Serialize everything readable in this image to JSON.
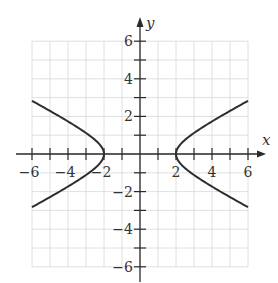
{
  "chart_data": {
    "type": "line",
    "title": "",
    "xlabel": "x",
    "ylabel": "y",
    "xlim": [
      -6,
      6
    ],
    "ylim": [
      -6,
      6
    ],
    "grid": true,
    "grid_step": 1,
    "x_ticks": [
      -6,
      -4,
      -2,
      2,
      4,
      6
    ],
    "y_ticks": [
      6,
      4,
      2,
      -2,
      -4,
      -6
    ],
    "x_tick_labels": [
      "−6",
      "−4",
      "−2",
      "2",
      "4",
      "6"
    ],
    "y_tick_labels": [
      "6",
      "4",
      "2",
      "−2",
      "−4",
      "−6"
    ],
    "series": [
      {
        "name": "hyperbola x^2/4 - y^2 = 1 (right branch)",
        "x": [
          6,
          5,
          4,
          3,
          2.5,
          2,
          2.5,
          3,
          4,
          5,
          6
        ],
        "y": [
          2.83,
          2.29,
          1.73,
          1.12,
          0.75,
          0,
          -0.75,
          -1.12,
          -1.73,
          -2.29,
          -2.83
        ]
      },
      {
        "name": "hyperbola x^2/4 - y^2 = 1 (left branch)",
        "x": [
          -6,
          -5,
          -4,
          -3,
          -2.5,
          -2,
          -2.5,
          -3,
          -4,
          -5,
          -6
        ],
        "y": [
          2.83,
          2.29,
          1.73,
          1.12,
          0.75,
          0,
          -0.75,
          -1.12,
          -1.73,
          -2.29,
          -2.83
        ]
      }
    ],
    "vertices": [
      [
        -2,
        0
      ],
      [
        2,
        0
      ]
    ],
    "equation": "x^2/4 - y^2 = 1"
  },
  "axes": {
    "x_label": "x",
    "y_label": "y"
  }
}
